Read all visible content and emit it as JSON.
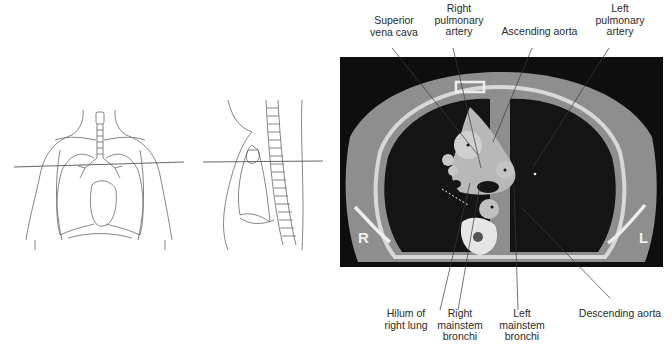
{
  "figure": {
    "left_panel": {
      "frontal_view": {
        "name": "frontal thorax outline with transverse plane line"
      },
      "lateral_view": {
        "name": "sagittal thorax outline with transverse plane line"
      }
    },
    "ct_image": {
      "side_labels": {
        "right": "R",
        "left": "L"
      },
      "colors": {
        "background": "#0e0e0e",
        "soft_tissue": "#9a9a9a",
        "lung": "#151515",
        "bone": "#e6e6e6",
        "vessel": "#c8c8c8"
      }
    },
    "top_labels": [
      {
        "id": "superior-vena-cava",
        "lines": [
          "Superior",
          "vena cava"
        ]
      },
      {
        "id": "right-pulmonary-artery",
        "lines": [
          "Right",
          "pulmonary",
          "artery"
        ]
      },
      {
        "id": "ascending-aorta",
        "lines": [
          "Ascending aorta"
        ]
      },
      {
        "id": "left-pulmonary-artery",
        "lines": [
          "Left",
          "pulmonary",
          "artery"
        ]
      }
    ],
    "bottom_labels": [
      {
        "id": "hilum-of-right-lung",
        "lines": [
          "Hilum of",
          "right lung"
        ]
      },
      {
        "id": "right-mainstem-bronchi",
        "lines": [
          "Right",
          "mainstem",
          "bronchi"
        ]
      },
      {
        "id": "left-mainstem-bronchi",
        "lines": [
          "Left",
          "mainstem",
          "bronchi"
        ]
      },
      {
        "id": "descending-aorta",
        "lines": [
          "Descending aorta"
        ]
      }
    ]
  }
}
